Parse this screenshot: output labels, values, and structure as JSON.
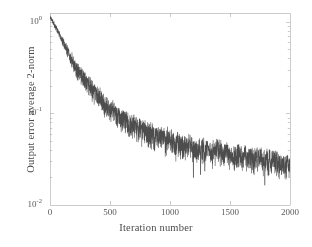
{
  "chart_data": {
    "type": "line",
    "title": "",
    "xlabel": "Iteration number",
    "ylabel": "Output error average 2-norm",
    "xlim": [
      0,
      2000
    ],
    "ylim": [
      0.01,
      1.25
    ],
    "yscale": "log",
    "xscale": "linear",
    "grid": false,
    "legend": null,
    "xticks": [
      0,
      500,
      1000,
      1500,
      2000
    ],
    "xtick_labels": [
      "0",
      "500",
      "1000",
      "1500",
      "2000"
    ],
    "yticks": [
      1,
      0.1,
      0.01
    ],
    "ytick_labels": [
      "10",
      "10",
      "10"
    ],
    "ytick_exponents": [
      "0",
      "-1",
      "-2"
    ],
    "series": [
      {
        "name": "output error average 2-norm",
        "color": "#4d4d4d",
        "linewidth": 0.6,
        "description": "Noisy monotonic decay on log scale from about 1.15 at iteration 0 to about 0.025 at iteration 2000",
        "envelope_x": [
          0,
          40,
          80,
          120,
          160,
          200,
          250,
          300,
          350,
          400,
          450,
          500,
          560,
          620,
          700,
          800,
          900,
          1000,
          1100,
          1200,
          1300,
          1400,
          1500,
          1600,
          1700,
          1800,
          1900,
          2000
        ],
        "envelope_mean": [
          1.15,
          0.92,
          0.72,
          0.56,
          0.44,
          0.35,
          0.275,
          0.225,
          0.185,
          0.155,
          0.132,
          0.115,
          0.098,
          0.086,
          0.074,
          0.063,
          0.056,
          0.05,
          0.046,
          0.043,
          0.04,
          0.038,
          0.036,
          0.034,
          0.032,
          0.031,
          0.029,
          0.027
        ],
        "noise_frac_low": [
          0.04,
          0.06,
          0.09,
          0.12,
          0.15,
          0.18,
          0.2,
          0.22,
          0.24,
          0.25,
          0.26,
          0.27,
          0.28,
          0.28,
          0.29,
          0.3,
          0.3,
          0.3,
          0.3,
          0.3,
          0.3,
          0.3,
          0.3,
          0.3,
          0.3,
          0.3,
          0.3,
          0.3
        ],
        "noise_frac_high": [
          0.03,
          0.05,
          0.07,
          0.09,
          0.11,
          0.13,
          0.15,
          0.16,
          0.17,
          0.18,
          0.18,
          0.19,
          0.2,
          0.2,
          0.21,
          0.22,
          0.22,
          0.22,
          0.22,
          0.22,
          0.22,
          0.22,
          0.22,
          0.22,
          0.22,
          0.22,
          0.22,
          0.22
        ],
        "dropout_spikes": [
          {
            "x": 1195,
            "value": 0.02
          },
          {
            "x": 1255,
            "value": 0.0215
          },
          {
            "x": 1290,
            "value": 0.0235
          },
          {
            "x": 1790,
            "value": 0.0165
          },
          {
            "x": 1930,
            "value": 0.0215
          }
        ],
        "n_points": 2000
      }
    ]
  },
  "axes": {
    "box_color": "#9a9a9a",
    "tick_color": "#9a9a9a",
    "background": "#ffffff"
  },
  "figure": {
    "background": "#ffffff"
  }
}
